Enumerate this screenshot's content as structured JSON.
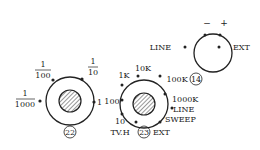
{
  "dial_22": {
    "number": "22",
    "labels": {
      "top_left": {
        "num": "1",
        "den": "100"
      },
      "top_right": {
        "num": "1",
        "den": "10"
      },
      "left": {
        "num": "1",
        "den": "1000"
      },
      "right": "1"
    }
  },
  "dial_23": {
    "number": "23",
    "labels": [
      "1K",
      "10K",
      "100K",
      "1000K",
      "LINE",
      "SWEEP",
      "EXT",
      "TV.H",
      "10",
      "100"
    ]
  },
  "dial_14": {
    "number": "14",
    "labels": {
      "minus": "−",
      "plus": "+",
      "left": "LINE",
      "right": "EXT"
    }
  }
}
